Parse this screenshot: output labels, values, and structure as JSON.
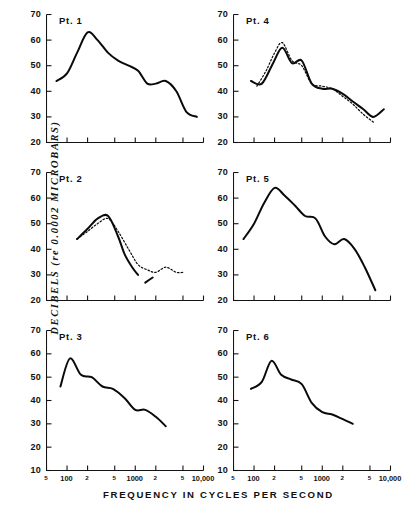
{
  "figure": {
    "y_axis_title": "DECIBELS  (re 0.0002 MICROBARS)",
    "x_axis_title": "FREQUENCY IN CYCLES PER SECOND"
  },
  "chart_data": [
    {
      "type": "line",
      "title": "Pt. 1",
      "xlabel": "FREQUENCY IN CYCLES PER SECOND",
      "ylabel": "DECIBELS (re 0.0002 MICROBARS)",
      "xscale": "log",
      "xlim": [
        50,
        10000
      ],
      "ylim": [
        20,
        70
      ],
      "yticks": [
        70,
        60,
        50,
        40,
        30,
        20
      ],
      "xticks": [
        50,
        100,
        200,
        500,
        1000,
        2000,
        5000,
        10000
      ],
      "xticklabels": [
        "5",
        "100",
        "2",
        "5",
        "1000",
        "2",
        "5",
        "10,000"
      ],
      "grid": false,
      "legend": "none",
      "series": [
        {
          "name": "Pt. 1 threshold",
          "style": "solid",
          "x": [
            70,
            100,
            140,
            200,
            280,
            400,
            560,
            800,
            1100,
            1500,
            2000,
            2800,
            4000,
            5600,
            8000
          ],
          "y": [
            44,
            47,
            55,
            63,
            60,
            55,
            52,
            50,
            48,
            43,
            43,
            44,
            40,
            32,
            30
          ]
        }
      ]
    },
    {
      "type": "line",
      "title": "Pt. 2",
      "xscale": "log",
      "xlim": [
        50,
        10000
      ],
      "ylim": [
        20,
        70
      ],
      "yticks": [
        70,
        60,
        50,
        40,
        30,
        20
      ],
      "xticks": [
        50,
        100,
        200,
        500,
        1000,
        2000,
        5000,
        10000
      ],
      "xticklabels": [
        "5",
        "100",
        "2",
        "5",
        "1000",
        "2",
        "5",
        "10,000"
      ],
      "grid": false,
      "legend": "none",
      "series": [
        {
          "name": "Pt. 2 solid",
          "style": "solid",
          "x": [
            140,
            200,
            280,
            400,
            560,
            700,
            900,
            1100
          ],
          "y": [
            44,
            48,
            52,
            53,
            45,
            38,
            33,
            30
          ]
        },
        {
          "name": "Pt. 2 dotted",
          "style": "dotted",
          "x": [
            140,
            200,
            280,
            400,
            560,
            800,
            1100,
            1500,
            2000,
            2800,
            4000,
            5000
          ],
          "y": [
            44,
            47,
            50,
            52,
            47,
            40,
            34,
            32,
            31,
            33,
            31,
            31
          ]
        },
        {
          "name": "Pt. 2 short segment",
          "style": "solid",
          "x": [
            1400,
            1800
          ],
          "y": [
            27,
            29
          ]
        }
      ]
    },
    {
      "type": "line",
      "title": "Pt. 3",
      "xscale": "log",
      "xlim": [
        50,
        10000
      ],
      "ylim": [
        10,
        70
      ],
      "yticks": [
        70,
        60,
        50,
        40,
        30,
        20,
        10
      ],
      "xticks": [
        50,
        100,
        200,
        500,
        1000,
        2000,
        5000,
        10000
      ],
      "xticklabels": [
        "5",
        "100",
        "2",
        "5",
        "1000",
        "2",
        "5",
        "10,000"
      ],
      "grid": false,
      "legend": "none",
      "series": [
        {
          "name": "Pt. 3 threshold",
          "style": "solid",
          "x": [
            80,
            110,
            160,
            230,
            330,
            470,
            700,
            1000,
            1400,
            2000,
            2800
          ],
          "y": [
            46,
            58,
            51,
            50,
            46,
            45,
            41,
            36,
            36,
            33,
            29
          ]
        }
      ]
    },
    {
      "type": "line",
      "title": "Pt. 4",
      "xscale": "log",
      "xlim": [
        50,
        10000
      ],
      "ylim": [
        20,
        70
      ],
      "yticks": [
        70,
        60,
        50,
        40,
        30,
        20
      ],
      "xticks": [
        50,
        100,
        200,
        500,
        1000,
        2000,
        5000,
        10000
      ],
      "xticklabels": [
        "5",
        "100",
        "2",
        "5",
        "1000",
        "2",
        "5",
        "10,000"
      ],
      "grid": false,
      "legend": "none",
      "series": [
        {
          "name": "Pt. 4 solid",
          "style": "solid",
          "x": [
            90,
            130,
            190,
            260,
            360,
            500,
            700,
            1000,
            1400,
            2000,
            2800,
            4000,
            5600,
            8000
          ],
          "y": [
            44,
            43,
            51,
            57,
            51,
            52,
            43,
            41,
            41,
            39,
            36,
            33,
            30,
            33
          ]
        },
        {
          "name": "Pt. 4 dotted",
          "style": "dotted",
          "x": [
            110,
            150,
            200,
            260,
            360,
            500,
            700,
            1000,
            1400,
            2000,
            2800,
            4000,
            5600
          ],
          "y": [
            42,
            48,
            55,
            59,
            52,
            50,
            43,
            42,
            41,
            38,
            35,
            31,
            28
          ]
        }
      ]
    },
    {
      "type": "line",
      "title": "Pt. 5",
      "xscale": "log",
      "xlim": [
        50,
        10000
      ],
      "ylim": [
        20,
        70
      ],
      "yticks": [
        70,
        60,
        50,
        40,
        30,
        20
      ],
      "xticks": [
        50,
        100,
        200,
        500,
        1000,
        2000,
        5000,
        10000
      ],
      "xticklabels": [
        "5",
        "100",
        "2",
        "5",
        "1000",
        "2",
        "5",
        "10,000"
      ],
      "grid": false,
      "legend": "none",
      "series": [
        {
          "name": "Pt. 5 threshold",
          "style": "solid",
          "x": [
            70,
            100,
            140,
            200,
            280,
            400,
            560,
            800,
            1100,
            1500,
            2100,
            3000,
            4200,
            6000
          ],
          "y": [
            44,
            50,
            58,
            64,
            61,
            57,
            53,
            52,
            45,
            42,
            44,
            40,
            33,
            24
          ]
        }
      ]
    },
    {
      "type": "line",
      "title": "Pt. 6",
      "xscale": "log",
      "xlim": [
        50,
        10000
      ],
      "ylim": [
        10,
        70
      ],
      "yticks": [
        70,
        60,
        50,
        40,
        30,
        20,
        10
      ],
      "xticks": [
        50,
        100,
        200,
        500,
        1000,
        2000,
        5000,
        10000
      ],
      "xticklabels": [
        "5",
        "100",
        "2",
        "5",
        "1000",
        "2",
        "5",
        "10,000"
      ],
      "grid": false,
      "legend": "none",
      "series": [
        {
          "name": "Pt. 6 threshold",
          "style": "solid",
          "x": [
            90,
            130,
            180,
            250,
            350,
            500,
            700,
            1000,
            1400,
            2000,
            2800
          ],
          "y": [
            45,
            48,
            57,
            51,
            49,
            47,
            39,
            35,
            34,
            32,
            30
          ]
        }
      ]
    }
  ]
}
